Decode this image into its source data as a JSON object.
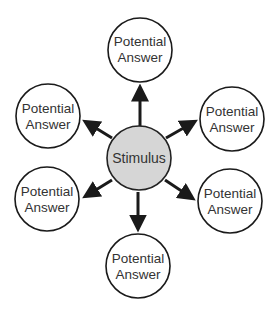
{
  "diagram": {
    "type": "hub-and-spoke",
    "center": {
      "label": "Stimulus",
      "fill": "#d6d6d6",
      "stroke": "#222222"
    },
    "nodes": [
      {
        "line1": "Potential",
        "line2": "Answer",
        "position": "top"
      },
      {
        "line1": "Potential",
        "line2": "Answer",
        "position": "upper-left"
      },
      {
        "line1": "Potential",
        "line2": "Answer",
        "position": "upper-right"
      },
      {
        "line1": "Potential",
        "line2": "Answer",
        "position": "lower-left"
      },
      {
        "line1": "Potential",
        "line2": "Answer",
        "position": "lower-right"
      },
      {
        "line1": "Potential",
        "line2": "Answer",
        "position": "bottom"
      }
    ],
    "edges": [
      {
        "from": "Stimulus",
        "to": "top"
      },
      {
        "from": "Stimulus",
        "to": "upper-left"
      },
      {
        "from": "Stimulus",
        "to": "upper-right"
      },
      {
        "from": "Stimulus",
        "to": "lower-left"
      },
      {
        "from": "Stimulus",
        "to": "lower-right"
      },
      {
        "from": "Stimulus",
        "to": "bottom"
      }
    ],
    "colors": {
      "node_fill": "#ffffff",
      "node_stroke": "#1a1a1a",
      "arrow": "#1a1a1a",
      "text": "#333333"
    }
  }
}
